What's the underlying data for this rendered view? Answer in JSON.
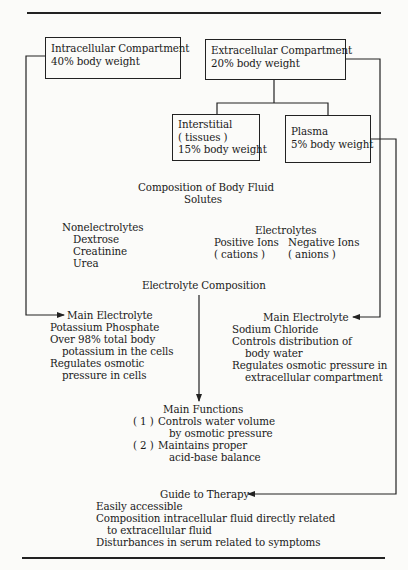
{
  "diagram": {
    "boxes": {
      "intracellular": {
        "title": "Intracellular Compartment",
        "value": "40% body weight"
      },
      "extracellular": {
        "title": "Extracellular Compartment",
        "value": "20% body weight"
      },
      "interstitial": {
        "title": "Interstitial",
        "sub": "( tissues )",
        "value": "15% body weight"
      },
      "plasma": {
        "title": "Plasma",
        "value": "5% body weight"
      }
    },
    "composition": {
      "title": "Composition of Body Fluid",
      "subtitle": "Solutes",
      "nonelectrolytes": {
        "heading": "Nonelectrolytes",
        "items": [
          "Dextrose",
          "Creatinine",
          "Urea"
        ]
      },
      "electrolytes": {
        "heading": "Electrolytes",
        "positive": {
          "label": "Positive Ions",
          "sub": "( cations )"
        },
        "negative": {
          "label": "Negative Ions",
          "sub": "( anions )"
        }
      }
    },
    "electrolyte_composition": {
      "title": "Electrolyte Composition",
      "intracellular": {
        "heading": "Main Electrolyte",
        "lines": [
          "Potassium Phosphate",
          "Over 98% total body",
          "potassium in the cells",
          "Regulates osmotic",
          "pressure in cells"
        ]
      },
      "extracellular": {
        "heading": "Main Electrolyte",
        "lines": [
          "Sodium Chloride",
          "Controls distribution of",
          "body water",
          "Regulates osmotic pressure in",
          "extracellular compartment"
        ]
      }
    },
    "main_functions": {
      "heading": "Main Functions",
      "items": [
        {
          "num": "( 1 )",
          "line1": "Controls water volume",
          "line2": "by osmotic pressure"
        },
        {
          "num": "( 2 )",
          "line1": "Maintains proper",
          "line2": "acid-base balance"
        }
      ]
    },
    "guide_to_therapy": {
      "heading": "Guide to Therapy",
      "lines": [
        "Easily accessible",
        "Composition intracellular fluid directly related",
        "to extracellular fluid",
        "Disturbances in serum related to symptoms"
      ]
    },
    "colors": {
      "ink": "#222222",
      "paper": "#fbfbf9"
    }
  }
}
